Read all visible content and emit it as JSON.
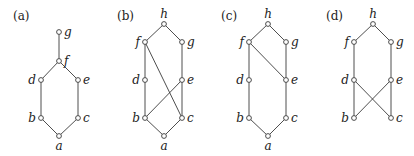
{
  "panels": [
    {
      "label": "(a)",
      "label_pos": [
        13,
        20
      ],
      "nodes": [
        {
          "id": "g",
          "x": 59,
          "y": 32,
          "lx": 64,
          "ly": 36,
          "anchor": "start"
        },
        {
          "id": "f",
          "x": 59,
          "y": 61,
          "lx": 64,
          "ly": 65,
          "anchor": "start"
        },
        {
          "id": "d",
          "x": 41,
          "y": 80,
          "lx": 36,
          "ly": 84,
          "anchor": "end"
        },
        {
          "id": "e",
          "x": 78,
          "y": 80,
          "lx": 83,
          "ly": 84,
          "anchor": "start"
        },
        {
          "id": "b",
          "x": 41,
          "y": 118,
          "lx": 36,
          "ly": 122,
          "anchor": "end"
        },
        {
          "id": "c",
          "x": 78,
          "y": 118,
          "lx": 83,
          "ly": 122,
          "anchor": "start"
        },
        {
          "id": "a",
          "x": 59,
          "y": 136,
          "lx": 59,
          "ly": 150,
          "anchor": "middle"
        }
      ],
      "edges": [
        [
          "g",
          "f"
        ],
        [
          "f",
          "d"
        ],
        [
          "f",
          "e"
        ],
        [
          "d",
          "b"
        ],
        [
          "e",
          "c"
        ],
        [
          "b",
          "a"
        ],
        [
          "c",
          "a"
        ]
      ]
    },
    {
      "label": "(b)",
      "label_pos": [
        117,
        20
      ],
      "nodes": [
        {
          "id": "h",
          "x": 164,
          "y": 24,
          "lx": 164,
          "ly": 18,
          "anchor": "middle"
        },
        {
          "id": "f",
          "x": 145,
          "y": 42,
          "lx": 140,
          "ly": 46,
          "anchor": "end"
        },
        {
          "id": "g",
          "x": 182,
          "y": 42,
          "lx": 187,
          "ly": 46,
          "anchor": "start"
        },
        {
          "id": "d",
          "x": 145,
          "y": 80,
          "lx": 140,
          "ly": 84,
          "anchor": "end"
        },
        {
          "id": "e",
          "x": 182,
          "y": 80,
          "lx": 187,
          "ly": 84,
          "anchor": "start"
        },
        {
          "id": "b",
          "x": 145,
          "y": 118,
          "lx": 140,
          "ly": 122,
          "anchor": "end"
        },
        {
          "id": "c",
          "x": 182,
          "y": 118,
          "lx": 187,
          "ly": 122,
          "anchor": "start"
        },
        {
          "id": "a",
          "x": 164,
          "y": 136,
          "lx": 164,
          "ly": 150,
          "anchor": "middle"
        }
      ],
      "edges": [
        [
          "h",
          "f"
        ],
        [
          "h",
          "g"
        ],
        [
          "f",
          "d"
        ],
        [
          "g",
          "e"
        ],
        [
          "d",
          "b"
        ],
        [
          "e",
          "c"
        ],
        [
          "b",
          "a"
        ],
        [
          "c",
          "a"
        ],
        [
          "f",
          "c"
        ],
        [
          "e",
          "b"
        ]
      ]
    },
    {
      "label": "(c)",
      "label_pos": [
        221,
        20
      ],
      "nodes": [
        {
          "id": "h",
          "x": 268,
          "y": 24,
          "lx": 268,
          "ly": 18,
          "anchor": "middle"
        },
        {
          "id": "f",
          "x": 249,
          "y": 42,
          "lx": 244,
          "ly": 46,
          "anchor": "end"
        },
        {
          "id": "g",
          "x": 286,
          "y": 42,
          "lx": 291,
          "ly": 46,
          "anchor": "start"
        },
        {
          "id": "d",
          "x": 249,
          "y": 80,
          "lx": 244,
          "ly": 84,
          "anchor": "end"
        },
        {
          "id": "e",
          "x": 286,
          "y": 80,
          "lx": 291,
          "ly": 84,
          "anchor": "start"
        },
        {
          "id": "b",
          "x": 249,
          "y": 118,
          "lx": 244,
          "ly": 122,
          "anchor": "end"
        },
        {
          "id": "c",
          "x": 286,
          "y": 118,
          "lx": 291,
          "ly": 122,
          "anchor": "start"
        },
        {
          "id": "a",
          "x": 268,
          "y": 136,
          "lx": 268,
          "ly": 150,
          "anchor": "middle"
        }
      ],
      "edges": [
        [
          "h",
          "f"
        ],
        [
          "h",
          "g"
        ],
        [
          "f",
          "d"
        ],
        [
          "f",
          "e"
        ],
        [
          "g",
          "e"
        ],
        [
          "d",
          "b"
        ],
        [
          "e",
          "c"
        ],
        [
          "b",
          "a"
        ],
        [
          "c",
          "a"
        ]
      ]
    },
    {
      "label": "(d)",
      "label_pos": [
        326,
        20
      ],
      "nodes": [
        {
          "id": "h",
          "x": 373,
          "y": 24,
          "lx": 373,
          "ly": 18,
          "anchor": "middle"
        },
        {
          "id": "f",
          "x": 354,
          "y": 42,
          "lx": 349,
          "ly": 46,
          "anchor": "end"
        },
        {
          "id": "g",
          "x": 391,
          "y": 42,
          "lx": 396,
          "ly": 46,
          "anchor": "start"
        },
        {
          "id": "d",
          "x": 354,
          "y": 80,
          "lx": 349,
          "ly": 84,
          "anchor": "end"
        },
        {
          "id": "e",
          "x": 391,
          "y": 80,
          "lx": 396,
          "ly": 84,
          "anchor": "start"
        },
        {
          "id": "b",
          "x": 354,
          "y": 118,
          "lx": 349,
          "ly": 122,
          "anchor": "end"
        },
        {
          "id": "c",
          "x": 391,
          "y": 118,
          "lx": 396,
          "ly": 122,
          "anchor": "start"
        }
      ],
      "edges": [
        [
          "h",
          "f"
        ],
        [
          "h",
          "g"
        ],
        [
          "f",
          "d"
        ],
        [
          "g",
          "e"
        ],
        [
          "d",
          "b"
        ],
        [
          "d",
          "c"
        ],
        [
          "e",
          "b"
        ],
        [
          "e",
          "c"
        ]
      ]
    }
  ]
}
